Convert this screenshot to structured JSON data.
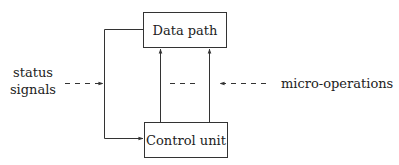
{
  "diagram": {
    "type": "block-diagram",
    "blocks": {
      "data_path": {
        "label": "Data path"
      },
      "control_unit": {
        "label": "Control unit"
      }
    },
    "labels": {
      "status_line1": "status",
      "status_line2": "signals",
      "micro_operations": "micro-operations"
    },
    "edges": [
      {
        "from": "data_path",
        "to": "control_unit",
        "style": "solid",
        "route": "left-loop",
        "label": "status signals"
      },
      {
        "from": "control_unit",
        "to": "data_path",
        "style": "solid",
        "count": 2,
        "label": "micro-operations"
      }
    ],
    "colors": {
      "line": "#333333",
      "background": "#ffffff"
    }
  }
}
